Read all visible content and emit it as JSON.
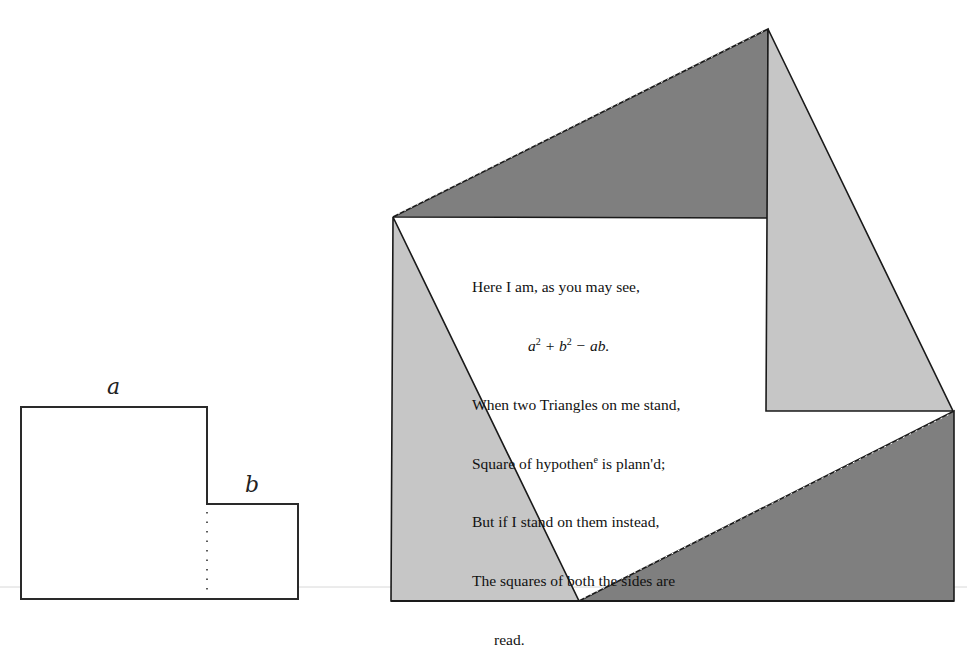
{
  "left_figure": {
    "label_a": "a",
    "label_b": "b",
    "description": "Two adjoining squares of sides a and b with a dotted divider"
  },
  "right_figure": {
    "description": "Square of hypotenuse formed by four right triangles around the a-b step shape",
    "colors": {
      "dark_triangle": "#7f7f7f",
      "light_triangle": "#c6c6c6",
      "outline": "#1a1a1a",
      "background": "#ffffff"
    }
  },
  "poem": {
    "line1": "Here I am, as you may see,",
    "line2_math": {
      "a": "a",
      "a_exp": "2",
      "plus": " + ",
      "b": "b",
      "b_exp": "2",
      "minus": " − ",
      "ab": "ab",
      "end": "."
    },
    "line3": "When two Triangles on me stand,",
    "line4_pre": "Square of hypothen",
    "line4_sup": "e",
    "line4_post": " is plann'd;",
    "line5": "But if I stand on them instead,",
    "line6": "The squares of both the sides are",
    "line7": "read."
  }
}
